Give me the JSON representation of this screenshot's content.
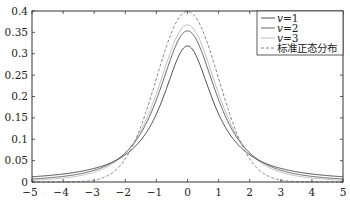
{
  "chart_data": {
    "type": "line",
    "title": "",
    "xlabel": "",
    "ylabel": "",
    "xlim": [
      -5,
      5
    ],
    "ylim": [
      0,
      0.4
    ],
    "grid": false,
    "legend_position": "upper right",
    "x_ticks": [
      -5,
      -4,
      -3,
      -2,
      -1,
      0,
      1,
      2,
      3,
      4,
      5
    ],
    "x_tick_labels": [
      "−5",
      "−4",
      "−3",
      "−2",
      "−1",
      "0",
      "1",
      "2",
      "3",
      "4",
      "5"
    ],
    "y_ticks": [
      0,
      0.05,
      0.1,
      0.15,
      0.2,
      0.25,
      0.3,
      0.35,
      0.4
    ],
    "y_tick_labels": [
      "0",
      "0.05",
      "0.1",
      "0.15",
      "0.2",
      "0.25",
      "0.3",
      "0.35",
      "0.4"
    ],
    "x": [
      -5,
      -4,
      -3,
      -2,
      -1,
      0,
      1,
      2,
      3,
      4,
      5
    ],
    "series": [
      {
        "name": "v=1",
        "label_var": "v",
        "label_val": "1",
        "kind": "t",
        "df": 1,
        "color": "#3a3a3a",
        "dash": "",
        "width": 0.9,
        "values": [
          0.0122,
          0.0187,
          0.0318,
          0.0637,
          0.1592,
          0.3183,
          0.1592,
          0.0637,
          0.0318,
          0.0187,
          0.0122
        ]
      },
      {
        "name": "v=2",
        "label_var": "v",
        "label_val": "2",
        "kind": "t",
        "df": 2,
        "color": "#555555",
        "dash": "",
        "width": 0.9,
        "values": [
          0.0071,
          0.0131,
          0.0274,
          0.068,
          0.1925,
          0.3536,
          0.1925,
          0.068,
          0.0274,
          0.0131,
          0.0071
        ]
      },
      {
        "name": "v=3",
        "label_var": "v",
        "label_val": "3",
        "kind": "t",
        "df": 3,
        "color": "#b8b8b8",
        "dash": "",
        "width": 0.9,
        "values": [
          0.0042,
          0.0092,
          0.023,
          0.0675,
          0.2067,
          0.3676,
          0.2067,
          0.0675,
          0.023,
          0.0092,
          0.0042
        ]
      },
      {
        "name": "标准正态分布",
        "kind": "normal",
        "color": "#777777",
        "dash": "3,2",
        "width": 0.9,
        "values": [
          0.0,
          0.0001,
          0.0044,
          0.054,
          0.242,
          0.3989,
          0.242,
          0.054,
          0.0044,
          0.0001,
          0.0
        ]
      }
    ]
  },
  "legend": {
    "items": [
      {
        "var": "v",
        "eq": "=",
        "val": "1"
      },
      {
        "var": "v",
        "eq": "=",
        "val": "2"
      },
      {
        "var": "v",
        "eq": "=",
        "val": "3"
      },
      {
        "text": "标准正态分布"
      }
    ]
  }
}
